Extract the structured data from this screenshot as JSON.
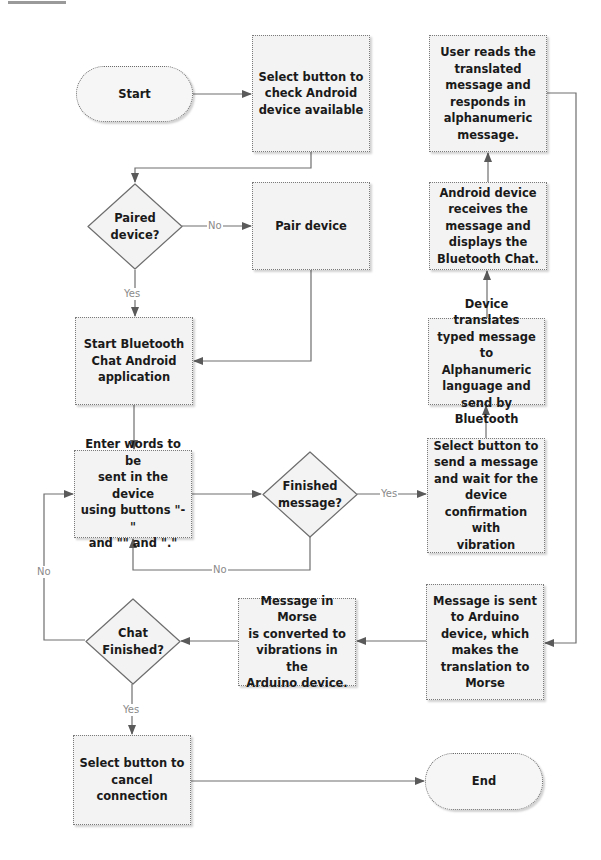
{
  "diagram": {
    "type": "flowchart",
    "nodes": {
      "start": "Start",
      "select_check": "Select button to\ncheck Android\ndevice available",
      "paired": "Paired\ndevice?",
      "pair_device": "Pair device",
      "start_bt": "Start Bluetooth\nChat Android\napplication",
      "enter_words": "Enter words to be\nsent in the device\nusing buttons \"-\"\nand \"\" and \".\"",
      "finished_message": "Finished\nmessage?",
      "select_send": "Select button to\nsend a message\nand wait for the\ndevice\nconfirmation with\nvibration",
      "device_translates": "Device translates\ntyped message to\nAlphanumeric\nlanguage and\nsend by Bluetooth",
      "android_receives": "Android device\nreceives the\nmessage and\ndisplays the\nBluetooth Chat.",
      "user_reads": "User reads the\ntranslated\nmessage and\nresponds in\nalphanumeric\nmessage.",
      "message_sent": "Message is sent\nto Arduino\ndevice, which\nmakes the\ntranslation to\nMorse",
      "morse_converted": "Message in Morse\nis converted to\nvibrations in the\nArduino device.",
      "chat_finished": "Chat\nFinished?",
      "select_cancel": "Select button to\ncancel connection",
      "end": "End"
    },
    "edge_labels": {
      "paired_no": "No",
      "paired_yes": "Yes",
      "finished_yes": "Yes",
      "finished_no": "No",
      "chat_no": "No",
      "chat_yes": "Yes"
    },
    "colors": {
      "box_fill": "#f3f3f3",
      "line": "#6e6e6e",
      "text": "#1a1a1a",
      "edge_label": "#8a8a8a"
    }
  }
}
